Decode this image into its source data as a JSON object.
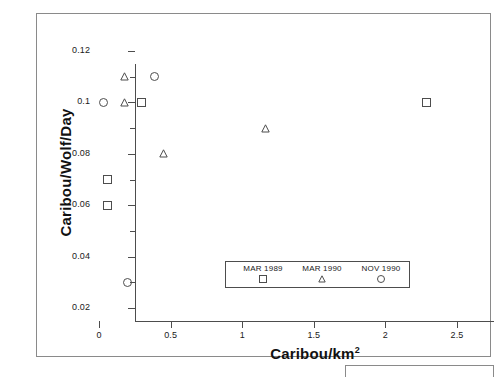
{
  "chart_data": {
    "type": "scatter",
    "title": "",
    "xlabel": "Caribou/km",
    "xlabel_sup": "2",
    "ylabel": "Caribou/Wolf/Day",
    "xlim": [
      0,
      2.5
    ],
    "ylim": [
      0.02,
      0.12
    ],
    "x_ticks": [
      "0",
      "0.5",
      "1",
      "1.5",
      "2",
      "2.5"
    ],
    "x_tick_values": [
      0,
      0.5,
      1,
      1.5,
      2,
      2.5
    ],
    "y_ticks": [
      "0.12",
      "0.1",
      "0.08",
      "0.06",
      "0.04",
      "0.02"
    ],
    "y_tick_values": [
      0.12,
      0.1,
      0.08,
      0.06,
      0.04,
      0.02
    ],
    "y_minor_ticks": [
      0.11,
      0.09,
      0.07,
      0.05,
      0.03
    ],
    "grid": false,
    "legend_position": "inside-bottom-center",
    "series": [
      {
        "name": "MAR 1989",
        "marker": "square",
        "points": [
          {
            "x": 0.06,
            "y": 0.07
          },
          {
            "x": 0.06,
            "y": 0.06
          },
          {
            "x": 0.3,
            "y": 0.1
          },
          {
            "x": 2.29,
            "y": 0.1
          }
        ]
      },
      {
        "name": "MAR 1990",
        "marker": "triangle",
        "points": [
          {
            "x": 0.18,
            "y": 0.11
          },
          {
            "x": 0.18,
            "y": 0.1
          },
          {
            "x": 0.45,
            "y": 0.08
          },
          {
            "x": 1.16,
            "y": 0.09
          }
        ]
      },
      {
        "name": "NOV 1990",
        "marker": "circle",
        "points": [
          {
            "x": 0.03,
            "y": 0.1
          },
          {
            "x": 0.39,
            "y": 0.11
          },
          {
            "x": 0.2,
            "y": 0.03
          }
        ]
      }
    ],
    "legend": [
      {
        "label": "MAR 1989",
        "marker": "square"
      },
      {
        "label": "MAR 1990",
        "marker": "triangle"
      },
      {
        "label": "NOV 1990",
        "marker": "circle"
      }
    ]
  },
  "colors": {
    "axis": "#4d4d4d",
    "frame": "#8a8a8a",
    "marker": "#4d4d4d",
    "text": "#1a1a1a",
    "background": "#ffffff"
  }
}
